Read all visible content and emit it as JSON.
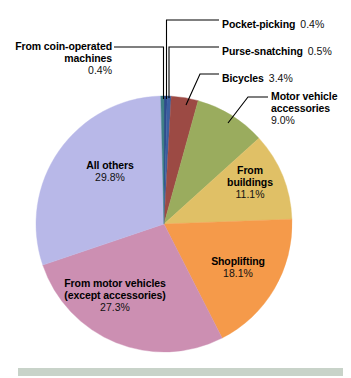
{
  "figure": {
    "background_color": "#ffffff",
    "bottom_bar_color": "#c8d3c9"
  },
  "chart_data": {
    "type": "pie",
    "title": "",
    "subtitle": "",
    "xlabel": "",
    "ylabel": "",
    "legend_position": "none",
    "grid": false,
    "value_unit": "percent",
    "total": 100.0,
    "start_angle_deg": 0,
    "direction": "clockwise",
    "categories": [
      "Pocket-picking",
      "Purse-snatching",
      "Bicycles",
      "Motor vehicle accessories",
      "From buildings",
      "Shoplifting",
      "From motor vehicles (except accessories)",
      "All others",
      "From coin-operated machines"
    ],
    "values": [
      0.4,
      0.5,
      3.4,
      9.0,
      11.1,
      18.1,
      27.3,
      29.8,
      0.4
    ],
    "colors": [
      "#2f4b8c",
      "#3a5fa0",
      "#9c4a44",
      "#9aac5e",
      "#e0c066",
      "#f59a4a",
      "#cc8fb2",
      "#b8b8e8",
      "#3f7f86"
    ],
    "slices": [
      {
        "label": "Pocket-picking",
        "value": 0.4,
        "value_text": "0.4%",
        "color": "#2f4b8c"
      },
      {
        "label": "Purse-snatching",
        "value": 0.5,
        "value_text": "0.5%",
        "color": "#3a5fa0"
      },
      {
        "label": "Bicycles",
        "value": 3.4,
        "value_text": "3.4%",
        "color": "#9c4a44"
      },
      {
        "label": "Motor vehicle accessories",
        "value": 9.0,
        "value_text": "9.0%",
        "color": "#9aac5e"
      },
      {
        "label": "From buildings",
        "value": 11.1,
        "value_text": "11.1%",
        "color": "#e0c066"
      },
      {
        "label": "Shoplifting",
        "value": 18.1,
        "value_text": "18.1%",
        "color": "#f59a4a"
      },
      {
        "label": "From motor vehicles (except accessories)",
        "value": 27.3,
        "value_text": "27.3%",
        "color": "#cc8fb2"
      },
      {
        "label": "All others",
        "value": 29.8,
        "value_text": "29.8%",
        "color": "#b8b8e8"
      },
      {
        "label": "From coin-operated machines",
        "value": 0.4,
        "value_text": "0.4%",
        "color": "#3f7f86"
      }
    ]
  },
  "labels": {
    "pocket_picking": {
      "name": "Pocket-picking",
      "pct": "0.4%"
    },
    "purse_snatching": {
      "name": "Purse-snatching",
      "pct": "0.5%"
    },
    "bicycles": {
      "name": "Bicycles",
      "pct": "3.4%"
    },
    "motor_vehicle_accessories": {
      "line1": "Motor vehicle",
      "line2": "accessories",
      "pct": "9.0%"
    },
    "from_buildings": {
      "line1": "From",
      "line2": "buildings",
      "pct": "11.1%"
    },
    "shoplifting": {
      "name": "Shoplifting",
      "pct": "18.1%"
    },
    "from_motor_vehicles": {
      "line1": "From motor vehicles",
      "line2": "(except accessories)",
      "pct": "27.3%"
    },
    "all_others": {
      "name": "All others",
      "pct": "29.8%"
    },
    "coin_operated": {
      "line1": "From coin-operated",
      "line2": "machines",
      "pct": "0.4%"
    }
  }
}
